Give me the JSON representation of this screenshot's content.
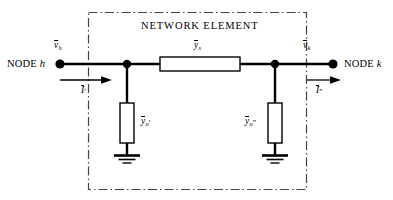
{
  "figure": {
    "type": "circuit-diagram",
    "title": "NETWORK ELEMENT",
    "background_color": "#ffffff",
    "line_color": "#000000"
  },
  "boundary": {
    "label": "NETWORK ELEMENT",
    "style": "dash-dot",
    "x": 88,
    "y": 12,
    "width": 219,
    "height": 178
  },
  "terminals": {
    "left": {
      "node_label_prefix": "NODE",
      "node_label_name": "h",
      "voltage_base": "v",
      "voltage_sub": "h",
      "current_base": "I",
      "current_prime": "′"
    },
    "right": {
      "node_label_prefix": "NODE",
      "node_label_name": "k",
      "voltage_base": "v",
      "voltage_sub": "k",
      "current_base": "I",
      "current_prime": "″"
    }
  },
  "elements": {
    "series": {
      "base": "y",
      "sub": "s",
      "prime": "",
      "orientation": "horizontal"
    },
    "shunt_left": {
      "base": "y",
      "sub": "o",
      "prime": "′",
      "orientation": "vertical",
      "termination": "ground"
    },
    "shunt_right": {
      "base": "y",
      "sub": "o",
      "prime": "″",
      "orientation": "vertical",
      "termination": "ground"
    }
  },
  "icons": {
    "ground_left": "ground-icon",
    "ground_right": "ground-icon",
    "arrow_left": "current-arrow-icon",
    "arrow_right": "current-arrow-icon"
  }
}
